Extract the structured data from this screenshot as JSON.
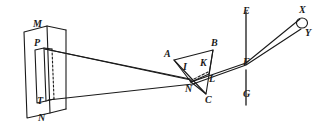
{
  "figure": {
    "type": "optics-ray-diagram",
    "background_color": "#ffffff",
    "ink_color": "#1a1a1a",
    "width": 323,
    "height": 132
  },
  "labels": {
    "M": "M",
    "N_plate": "N",
    "P": "P",
    "T": "T",
    "A": "A",
    "B": "B",
    "C": "C",
    "I": "I",
    "K": "K",
    "L": "L",
    "N_prism": "N",
    "E": "E",
    "F": "F",
    "G": "G",
    "X": "X",
    "Y": "Y"
  },
  "parts": {
    "plate": "aperture-plate-MN",
    "slit": "slit-PT",
    "beam": "converging-light-beam",
    "prism": "prism-ABC",
    "screen": "screen-EG",
    "spectrum": "spectrum-XY"
  },
  "label_positions": {
    "M": {
      "x": 33,
      "y": 23
    },
    "N_plate": {
      "x": 38,
      "y": 113
    },
    "P": {
      "x": 33,
      "y": 45
    },
    "T": {
      "x": 36,
      "y": 97
    },
    "A": {
      "x": 165,
      "y": 54
    },
    "B": {
      "x": 211,
      "y": 42
    },
    "C": {
      "x": 205,
      "y": 98
    },
    "I": {
      "x": 184,
      "y": 66
    },
    "K": {
      "x": 202,
      "y": 64
    },
    "L": {
      "x": 209,
      "y": 79
    },
    "N_prism": {
      "x": 187,
      "y": 86
    },
    "E": {
      "x": 243,
      "y": 8
    },
    "F": {
      "x": 243,
      "y": 58
    },
    "G": {
      "x": 243,
      "y": 92
    },
    "X": {
      "x": 297,
      "y": 8
    },
    "Y": {
      "x": 302,
      "y": 30
    }
  }
}
